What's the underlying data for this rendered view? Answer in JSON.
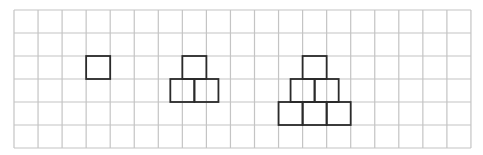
{
  "grid": {
    "origin_x": 14,
    "origin_y": 10,
    "cell_w": 24.05,
    "cell_h": 23,
    "columns": 19,
    "rows": 6,
    "line_color": "#c4c4c4",
    "line_width": 1.2
  },
  "figures": [
    {
      "name": "figure-1-single-square",
      "squares": [
        {
          "col": 3,
          "row": 2
        }
      ]
    },
    {
      "name": "figure-2-three-squares",
      "squares": [
        {
          "col": 7,
          "row": 2
        },
        {
          "col": 6.5,
          "row": 3
        },
        {
          "col": 7.5,
          "row": 3
        }
      ]
    },
    {
      "name": "figure-3-six-squares",
      "squares": [
        {
          "col": 12,
          "row": 2
        },
        {
          "col": 11.5,
          "row": 3
        },
        {
          "col": 12.5,
          "row": 3
        },
        {
          "col": 11,
          "row": 4
        },
        {
          "col": 12,
          "row": 4
        },
        {
          "col": 13,
          "row": 4
        }
      ]
    }
  ],
  "figure_style": {
    "stroke_color": "#2a2a2a",
    "stroke_width": 1.8
  }
}
